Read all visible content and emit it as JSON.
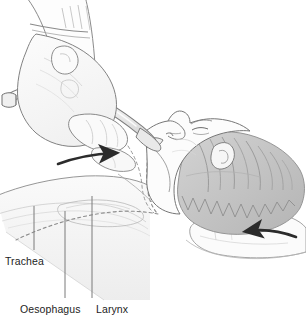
{
  "figure": {
    "background_color": "#ffffff",
    "width": 306,
    "height": 322
  },
  "labels": [
    {
      "id": "trachea",
      "text": "Trachea",
      "text_x": 5,
      "text_y": 265,
      "leader_x": 34,
      "leader_top": 206,
      "leader_bottom": 250
    },
    {
      "id": "oesophagus",
      "text": "Oesophagus",
      "text_x": 20,
      "text_y": 313,
      "leader_x": 65,
      "leader_top": 211,
      "leader_bottom": 298
    },
    {
      "id": "larynx",
      "text": "Larynx",
      "text_x": 96,
      "text_y": 313,
      "leader_x": 92,
      "leader_top": 196,
      "leader_bottom": 298
    }
  ],
  "arrows": [
    {
      "id": "airway-arrow",
      "direction": "right",
      "description": "curved arrow indicating tube advancing into airway"
    },
    {
      "id": "head-tilt-arrow",
      "direction": "left",
      "description": "curved arrow indicating head tilt / jaw thrust"
    }
  ],
  "anatomy": [
    {
      "id": "forearm-sleeve",
      "name": "sleeve-cuff"
    },
    {
      "id": "hand",
      "name": "operator-hand"
    },
    {
      "id": "laryngoscope",
      "name": "laryngoscope-tube"
    },
    {
      "id": "head",
      "name": "patient-head-profile"
    },
    {
      "id": "hair",
      "name": "patient-hair"
    },
    {
      "id": "neck",
      "name": "patient-neck"
    },
    {
      "id": "pillow",
      "name": "head-support-pillow"
    },
    {
      "id": "airway-dashed",
      "name": "airway-outline-dashed"
    }
  ],
  "colors": {
    "ink": "#6e6e6e",
    "ink_dark": "#3a3a3a",
    "arrow": "#2b2b2b",
    "label_text": "#1d1d1d",
    "leader_line": "#7a7a7a",
    "fill_light": "#f4f4f4",
    "fill_mid": "#e3e3e3",
    "fill_hair": "#c9c9c9",
    "fill_hair_dark": "#a8a8a8",
    "background": "#ffffff"
  }
}
